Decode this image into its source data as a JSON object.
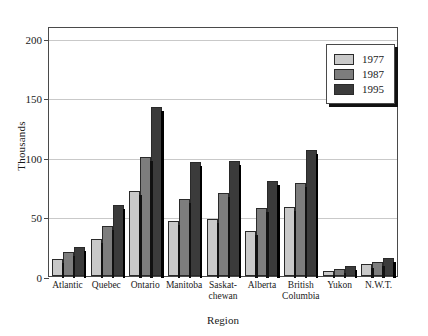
{
  "chart_data": {
    "type": "bar",
    "title": "",
    "xlabel": "Region",
    "ylabel": "Thousands",
    "categories": [
      "Atlantic",
      "Quebec",
      "Ontario",
      "Manitoba",
      "Saskat-chewan",
      "Alberta",
      "British Columbia",
      "Yukon",
      "N.W.T."
    ],
    "category_lines": [
      [
        "Atlantic"
      ],
      [
        "Quebec"
      ],
      [
        "Ontario"
      ],
      [
        "Manitoba"
      ],
      [
        "Saskat-",
        "chewan"
      ],
      [
        "Alberta"
      ],
      [
        "British",
        "Columbia"
      ],
      [
        "Yukon"
      ],
      [
        "N.W.T."
      ]
    ],
    "series": [
      {
        "name": "1977",
        "color": "#c9c9c9",
        "values": [
          14,
          31,
          71,
          46,
          48,
          38,
          58,
          4,
          10
        ]
      },
      {
        "name": "1987",
        "color": "#7d7d7d",
        "values": [
          20,
          42,
          100,
          65,
          70,
          57,
          78,
          6,
          12
        ]
      },
      {
        "name": "1995",
        "color": "#3b3b3b",
        "values": [
          24,
          60,
          142,
          96,
          97,
          80,
          106,
          8,
          15
        ]
      }
    ],
    "ylim": [
      0,
      210
    ],
    "yticks": [
      0,
      50,
      100,
      150,
      200
    ],
    "ytick_labels": [
      "0",
      "50",
      "100",
      "150",
      "200"
    ],
    "grid": true,
    "legend_position": "top-right",
    "units": "Thousands"
  }
}
